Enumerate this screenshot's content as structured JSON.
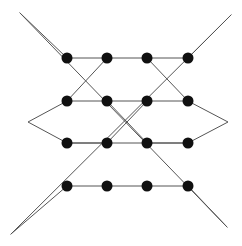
{
  "figure": {
    "type": "line-drawing",
    "canvas": {
      "width": 242,
      "height": 246,
      "background": "#ffffff"
    },
    "style": {
      "line_color": "#555555",
      "line_width": 1,
      "dot_color": "#101010",
      "dot_radius": 5.5
    },
    "dot_grid": {
      "columns_x": [
        67,
        107,
        147,
        188
      ],
      "rows_y": [
        58,
        101,
        143,
        186
      ],
      "count": 16
    },
    "dots": [
      {
        "id": "r1c1",
        "x": 67,
        "y": 58
      },
      {
        "id": "r1c2",
        "x": 107,
        "y": 58
      },
      {
        "id": "r1c3",
        "x": 147,
        "y": 58
      },
      {
        "id": "r1c4",
        "x": 188,
        "y": 58
      },
      {
        "id": "r2c1",
        "x": 67,
        "y": 101
      },
      {
        "id": "r2c2",
        "x": 107,
        "y": 101
      },
      {
        "id": "r2c3",
        "x": 147,
        "y": 101
      },
      {
        "id": "r2c4",
        "x": 188,
        "y": 101
      },
      {
        "id": "r3c1",
        "x": 67,
        "y": 143
      },
      {
        "id": "r3c2",
        "x": 107,
        "y": 143
      },
      {
        "id": "r3c3",
        "x": 147,
        "y": 143
      },
      {
        "id": "r3c4",
        "x": 188,
        "y": 143
      },
      {
        "id": "r4c1",
        "x": 67,
        "y": 186
      },
      {
        "id": "r4c2",
        "x": 107,
        "y": 186
      },
      {
        "id": "r4c3",
        "x": 147,
        "y": 186
      },
      {
        "id": "r4c4",
        "x": 188,
        "y": 186
      }
    ],
    "vertices": {
      "top_left": {
        "x": 20,
        "y": 13
      },
      "top_right": {
        "x": 231,
        "y": 15
      },
      "bottom_left": {
        "x": 11,
        "y": 234
      },
      "bottom_right": {
        "x": 227,
        "y": 227
      },
      "mid_left": {
        "x": 28,
        "y": 122
      },
      "mid_right": {
        "x": 228,
        "y": 122
      }
    },
    "paths": [
      {
        "id": "path-zigzag-upper",
        "name": "upper-zigzag-chain",
        "d": "M 20 13 L 67 58 L 107 58 L 147 58 L 188 58 L 231 15"
      },
      {
        "id": "path-zigzag-left-diamond",
        "name": "left-diamond-chain",
        "d": "M 107 58 L 67 101 L 28 122 L 67 143 L 107 143"
      },
      {
        "id": "path-zigzag-right-diamond",
        "name": "right-diamond-chain",
        "d": "M 147 58 L 188 101 L 228 122 L 188 143 L 147 143"
      },
      {
        "id": "path-mid-left-upper",
        "name": "mid-left-upper-segment",
        "d": "M 67 101 L 107 101 L 147 101 L 188 101"
      },
      {
        "id": "path-mid-left-lower",
        "name": "mid-left-lower-segment",
        "d": "M 67 143 L 107 143 L 147 143 L 188 143"
      },
      {
        "id": "path-zigzag-lower",
        "name": "lower-zigzag-chain",
        "d": "M 11 234 L 67 186 L 107 186 L 147 186 L 188 186 L 227 227"
      },
      {
        "id": "path-diag-tl-br",
        "name": "diagonal-top-left-to-bottom-right",
        "d": "M 20 13 L 227 227"
      },
      {
        "id": "path-diag-tr-bl",
        "name": "diagonal-top-right-to-bottom-left",
        "d": "M 231 15 L 11 234"
      },
      {
        "id": "path-x-center-a",
        "name": "center-cross-nw-se",
        "d": "M 107 101 L 147 143"
      },
      {
        "id": "path-x-center-b",
        "name": "center-cross-ne-sw",
        "d": "M 147 101 L 107 143"
      }
    ]
  }
}
